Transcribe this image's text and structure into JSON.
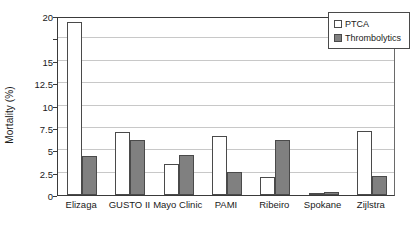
{
  "chart_data": {
    "type": "bar",
    "title": "",
    "subtitle": "",
    "xlabel": "",
    "ylabel": "Mortality (%)",
    "categories": [
      "Elizaga",
      "GUSTO II",
      "Mayo Clinic",
      "PAMI",
      "Ribeiro",
      "Spokane",
      "Zijlstra"
    ],
    "series": [
      {
        "name": "PTCA",
        "color": "#ffffff",
        "values": [
          19.3,
          7.0,
          3.5,
          6.6,
          2.0,
          0.25,
          7.2
        ]
      },
      {
        "name": "Thrombolytics",
        "color": "#808080",
        "values": [
          4.4,
          6.1,
          4.5,
          2.6,
          6.2,
          0.3,
          2.1
        ]
      }
    ],
    "ylim": [
      0,
      20
    ],
    "ytick_values": [
      0,
      2.5,
      5,
      7.5,
      10,
      12.5,
      15,
      17.5,
      20
    ],
    "ytick_labels": [
      "0",
      "2.5",
      "5",
      "7.5",
      "10",
      "12.5",
      "15",
      "",
      "20"
    ],
    "grid": true,
    "grid_axis": "y",
    "legend_position": "top-right"
  },
  "legend": {
    "items": [
      {
        "label": "PTCA",
        "swatch": "ptca"
      },
      {
        "label": "Thrombolytics",
        "swatch": "thromb"
      }
    ]
  }
}
